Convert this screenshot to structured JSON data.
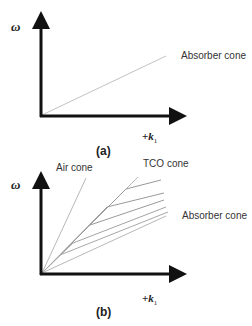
{
  "panel_a": {
    "y_label": "ω",
    "x_label_sign": "+",
    "x_label_var": "k",
    "x_label_sub": "1",
    "cone_label": "Absorber cone",
    "caption": "(a)"
  },
  "panel_b": {
    "y_label": "ω",
    "x_label_sign": "+",
    "x_label_var": "k",
    "x_label_sub": "1",
    "air_cone_label": "Air cone",
    "tco_cone_label": "TCO cone",
    "absorber_cone_label": "Absorber cone",
    "caption": "(b)"
  },
  "colors": {
    "axis": "#111111",
    "cone_line": "#b0b0b0",
    "mode_line": "#8a8a8a"
  }
}
